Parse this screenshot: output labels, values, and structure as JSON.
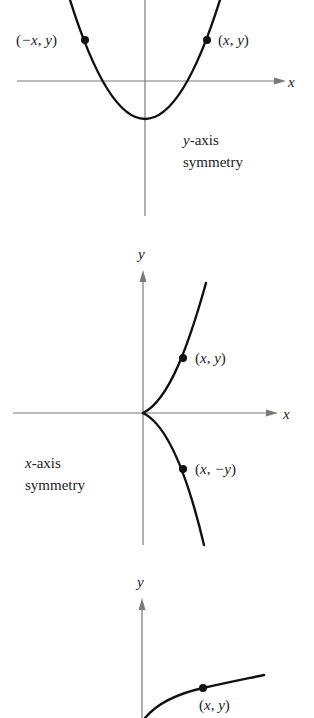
{
  "panels": [
    {
      "name": "y-axis-symmetry",
      "caption_line1_var": "y",
      "caption_line1_rest": "-axis",
      "caption_line2": "symmetry",
      "axis_x_label": "x",
      "points": [
        {
          "label": "(−x, y)"
        },
        {
          "label": "(x, y)"
        }
      ]
    },
    {
      "name": "x-axis-symmetry",
      "caption_line1_var": "x",
      "caption_line1_rest": "-axis",
      "caption_line2": "symmetry",
      "axis_x_label": "x",
      "axis_y_label": "y",
      "points": [
        {
          "label": "(x, y)"
        },
        {
          "label": "(x, −y)"
        }
      ]
    },
    {
      "name": "origin-symmetry-partial",
      "axis_y_label": "y",
      "points": [
        {
          "label": "(x, y)"
        }
      ]
    }
  ],
  "colors": {
    "axis": "#7a7a7a",
    "curve": "#111111",
    "text": "#222222"
  }
}
